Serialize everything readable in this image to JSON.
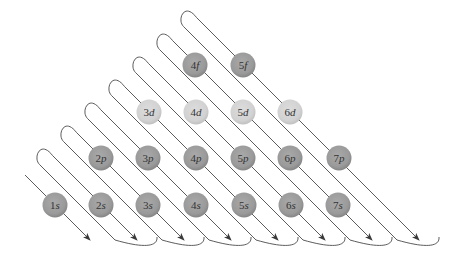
{
  "title": "",
  "colors": {
    "line": "#4a4a4a",
    "orbital_dark": "#9c9c9c",
    "orbital_dark_edge": "#858585",
    "orbital_light": "#d4d4d4",
    "orbital_light_edge": "#c2c2c2",
    "label": "#333333"
  },
  "diagonals": [
    {
      "index": 1,
      "orbitals": [
        "1s"
      ]
    },
    {
      "index": 2,
      "orbitals": [
        "2s"
      ]
    },
    {
      "index": 3,
      "orbitals": [
        "2p",
        "3s"
      ]
    },
    {
      "index": 4,
      "orbitals": [
        "3p",
        "4s"
      ]
    },
    {
      "index": 5,
      "orbitals": [
        "3d",
        "4p",
        "5s"
      ]
    },
    {
      "index": 6,
      "orbitals": [
        "4d",
        "5p",
        "6s"
      ]
    },
    {
      "index": 7,
      "orbitals": [
        "4f",
        "5d",
        "6p",
        "7s"
      ]
    },
    {
      "index": 8,
      "orbitals": [
        "5f",
        "6d",
        "7p"
      ]
    }
  ],
  "orbitals": [
    {
      "n": "1",
      "l": "s",
      "cx": 55,
      "cy": 205,
      "shade": "dark"
    },
    {
      "n": "2",
      "l": "s",
      "cx": 101,
      "cy": 205,
      "shade": "dark"
    },
    {
      "n": "3",
      "l": "s",
      "cx": 148,
      "cy": 205,
      "shade": "dark"
    },
    {
      "n": "4",
      "l": "s",
      "cx": 196,
      "cy": 205,
      "shade": "dark"
    },
    {
      "n": "5",
      "l": "s",
      "cx": 244,
      "cy": 205,
      "shade": "dark"
    },
    {
      "n": "6",
      "l": "s",
      "cx": 291,
      "cy": 205,
      "shade": "dark"
    },
    {
      "n": "7",
      "l": "s",
      "cx": 338,
      "cy": 205,
      "shade": "dark"
    },
    {
      "n": "2",
      "l": "p",
      "cx": 101,
      "cy": 158,
      "shade": "dark"
    },
    {
      "n": "3",
      "l": "p",
      "cx": 148,
      "cy": 158,
      "shade": "dark"
    },
    {
      "n": "4",
      "l": "p",
      "cx": 196,
      "cy": 158,
      "shade": "dark"
    },
    {
      "n": "5",
      "l": "p",
      "cx": 243,
      "cy": 158,
      "shade": "dark"
    },
    {
      "n": "6",
      "l": "p",
      "cx": 290,
      "cy": 158,
      "shade": "dark"
    },
    {
      "n": "7",
      "l": "p",
      "cx": 339,
      "cy": 158,
      "shade": "dark"
    },
    {
      "n": "3",
      "l": "d",
      "cx": 149,
      "cy": 112,
      "shade": "light"
    },
    {
      "n": "4",
      "l": "d",
      "cx": 196,
      "cy": 112,
      "shade": "light"
    },
    {
      "n": "5",
      "l": "d",
      "cx": 243,
      "cy": 112,
      "shade": "light"
    },
    {
      "n": "6",
      "l": "d",
      "cx": 290,
      "cy": 112,
      "shade": "light"
    },
    {
      "n": "4",
      "l": "f",
      "cx": 195,
      "cy": 65,
      "shade": "dark"
    },
    {
      "n": "5",
      "l": "f",
      "cx": 243,
      "cy": 65,
      "shade": "dark"
    }
  ],
  "geometry": {
    "first_line_offset": 150,
    "diagonal_spacing": 47,
    "arrow_y": 240,
    "orbital_radius": 12.5,
    "hairpin_offset": 22,
    "apex_x0": 45,
    "apex_step": 24
  }
}
